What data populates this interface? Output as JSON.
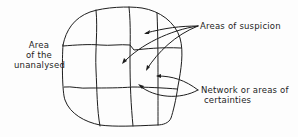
{
  "diagram": {
    "labels": {
      "unanalysed_line1": "Area",
      "unanalysed_line2": "of the",
      "unanalysed_line3": "unanalysed",
      "suspicion": "Areas of suspicion",
      "certainties_line1": "Network or areas of",
      "certainties_line2": "certainties"
    },
    "colors": {
      "ink": "#1e1e1e",
      "background": "#fdfdfd"
    },
    "grid": {
      "vertical_lines": 3,
      "horizontal_lines": 2
    },
    "arrows": {
      "suspicion_count": 3,
      "certainties_count": 2
    }
  }
}
